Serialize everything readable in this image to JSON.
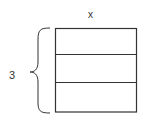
{
  "diagram": {
    "width_label": "x",
    "height_label": "3",
    "rows": 3,
    "stroke_color": "#333333",
    "background": "#ffffff"
  }
}
